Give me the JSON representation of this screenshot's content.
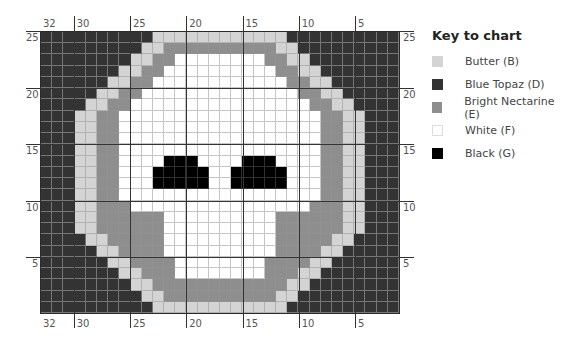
{
  "chart": {
    "columns": 32,
    "rows": 25,
    "top_col_labels": [
      {
        "text": "32",
        "col": 32
      },
      {
        "text": "30",
        "col": 30
      },
      {
        "text": "25",
        "col": 25
      },
      {
        "text": "20",
        "col": 20
      },
      {
        "text": "15",
        "col": 15
      },
      {
        "text": "10",
        "col": 10
      },
      {
        "text": "5",
        "col": 5
      }
    ],
    "bottom_col_labels": [
      {
        "text": "32",
        "col": 32
      },
      {
        "text": "30",
        "col": 30
      },
      {
        "text": "25",
        "col": 25
      },
      {
        "text": "20",
        "col": 20
      },
      {
        "text": "15",
        "col": 15
      },
      {
        "text": "10",
        "col": 10
      },
      {
        "text": "5",
        "col": 5
      }
    ],
    "left_row_labels": [
      "25",
      "20",
      "15",
      "10",
      "5"
    ],
    "right_row_labels": [
      "25",
      "20",
      "15",
      "10",
      "5"
    ],
    "row_label_values": [
      25,
      20,
      15,
      10,
      5
    ],
    "left_half_runs": {
      "25": [
        [
          "D",
          10
        ],
        [
          "B",
          6
        ]
      ],
      "24": [
        [
          "D",
          9
        ],
        [
          "B",
          2
        ],
        [
          "E",
          5
        ]
      ],
      "23": [
        [
          "D",
          8
        ],
        [
          "B",
          2
        ],
        [
          "E",
          2
        ],
        [
          "F",
          4
        ]
      ],
      "22": [
        [
          "D",
          7
        ],
        [
          "B",
          2
        ],
        [
          "E",
          2
        ],
        [
          "F",
          5
        ]
      ],
      "21": [
        [
          "D",
          6
        ],
        [
          "B",
          2
        ],
        [
          "E",
          2
        ],
        [
          "F",
          6
        ]
      ],
      "20": [
        [
          "D",
          5
        ],
        [
          "B",
          2
        ],
        [
          "E",
          2
        ],
        [
          "F",
          7
        ]
      ],
      "19": [
        [
          "D",
          4
        ],
        [
          "B",
          2
        ],
        [
          "E",
          2
        ],
        [
          "F",
          8
        ]
      ],
      "18": [
        [
          "D",
          3
        ],
        [
          "B",
          2
        ],
        [
          "E",
          2
        ],
        [
          "F",
          9
        ]
      ],
      "17": [
        [
          "D",
          3
        ],
        [
          "B",
          2
        ],
        [
          "E",
          2
        ],
        [
          "F",
          9
        ]
      ],
      "16": [
        [
          "D",
          3
        ],
        [
          "B",
          2
        ],
        [
          "E",
          2
        ],
        [
          "F",
          9
        ]
      ],
      "15": [
        [
          "D",
          3
        ],
        [
          "B",
          2
        ],
        [
          "E",
          2
        ],
        [
          "F",
          9
        ]
      ],
      "14": [
        [
          "D",
          3
        ],
        [
          "B",
          2
        ],
        [
          "E",
          2
        ],
        [
          "F",
          4
        ],
        [
          "G",
          3
        ],
        [
          "F",
          2
        ]
      ],
      "13": [
        [
          "D",
          3
        ],
        [
          "B",
          2
        ],
        [
          "E",
          2
        ],
        [
          "F",
          3
        ],
        [
          "G",
          5
        ],
        [
          "F",
          1
        ]
      ],
      "12": [
        [
          "D",
          3
        ],
        [
          "B",
          2
        ],
        [
          "E",
          2
        ],
        [
          "F",
          3
        ],
        [
          "G",
          5
        ],
        [
          "F",
          1
        ]
      ],
      "11": [
        [
          "D",
          3
        ],
        [
          "B",
          2
        ],
        [
          "E",
          2
        ],
        [
          "F",
          9
        ]
      ],
      "10": [
        [
          "D",
          3
        ],
        [
          "B",
          2
        ],
        [
          "E",
          3
        ],
        [
          "F",
          8
        ]
      ],
      "9": [
        [
          "D",
          3
        ],
        [
          "B",
          2
        ],
        [
          "E",
          6
        ],
        [
          "F",
          5
        ]
      ],
      "8": [
        [
          "D",
          3
        ],
        [
          "B",
          2
        ],
        [
          "E",
          6
        ],
        [
          "F",
          5
        ]
      ],
      "7": [
        [
          "D",
          4
        ],
        [
          "B",
          2
        ],
        [
          "E",
          5
        ],
        [
          "F",
          5
        ]
      ],
      "6": [
        [
          "D",
          5
        ],
        [
          "B",
          2
        ],
        [
          "E",
          4
        ],
        [
          "F",
          5
        ]
      ],
      "5": [
        [
          "D",
          6
        ],
        [
          "B",
          2
        ],
        [
          "E",
          4
        ],
        [
          "F",
          4
        ]
      ],
      "4": [
        [
          "D",
          7
        ],
        [
          "B",
          2
        ],
        [
          "E",
          3
        ],
        [
          "F",
          4
        ]
      ],
      "3": [
        [
          "D",
          8
        ],
        [
          "B",
          2
        ],
        [
          "E",
          6
        ]
      ],
      "2": [
        [
          "D",
          9
        ],
        [
          "B",
          2
        ],
        [
          "E",
          5
        ]
      ],
      "1": [
        [
          "D",
          10
        ],
        [
          "B",
          6
        ]
      ]
    },
    "right_eye": {
      "14": [
        18,
        20
      ],
      "13": [
        17,
        21
      ],
      "12": [
        17,
        21
      ]
    }
  },
  "key": {
    "title": "Key to chart",
    "items": [
      {
        "code": "B",
        "label": "Butter (B)",
        "color": "#d4d4d4"
      },
      {
        "code": "D",
        "label": "Blue Topaz (D)",
        "color": "#333333"
      },
      {
        "code": "E",
        "label": "Bright Nectarine (E)",
        "color": "#8e8e8e"
      },
      {
        "code": "F",
        "label": "White (F)",
        "color": "#ffffff"
      },
      {
        "code": "G",
        "label": "Black (G)",
        "color": "#000000"
      }
    ]
  }
}
